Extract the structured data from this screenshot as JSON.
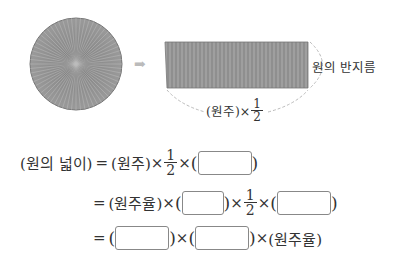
{
  "diagram": {
    "arrow_glyph": "➡",
    "radius_label": "원의 반지름",
    "base_label_prefix": "(원주)×",
    "half": {
      "num": "1",
      "den": "2"
    }
  },
  "formula": {
    "line1": {
      "lhs": "(원의 넓이)",
      "eq": "=",
      "t1": "(원주)",
      "times": "×",
      "open": "(",
      "close": ")"
    },
    "line2": {
      "eq": "=",
      "t1": "(원주율)",
      "times": "×",
      "open": "(",
      "close": ")"
    },
    "line3": {
      "eq": "=",
      "t_end": "(원주율)",
      "times": "×",
      "open": "(",
      "close": ")"
    },
    "half": {
      "num": "1",
      "den": "2"
    }
  }
}
